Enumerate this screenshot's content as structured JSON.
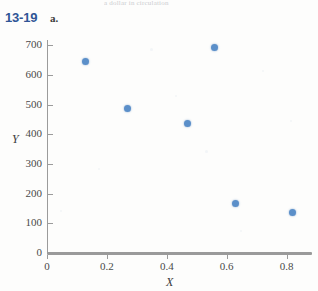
{
  "header": {
    "exercise_number": "13-19",
    "part_label": "a.",
    "top_cut_text": "a dollar in circulation"
  },
  "colors": {
    "marker": "#5b8fc9",
    "exercise_number": "#2f5596",
    "axis": "#9b9b9b",
    "text": "#4a4a4a"
  },
  "chart_data": {
    "type": "scatter",
    "title": "",
    "xlabel": "X",
    "ylabel": "Y",
    "xlim": [
      0,
      0.885
    ],
    "ylim": [
      0,
      715
    ],
    "grid": false,
    "legend": null,
    "xticks": [
      "0",
      "0.2",
      "0.4",
      "0.6",
      "0.8"
    ],
    "xtick_values": [
      0,
      0.2,
      0.4,
      0.6,
      0.8
    ],
    "yticks": [
      "0",
      "100",
      "200",
      "300",
      "400",
      "500",
      "600",
      "700"
    ],
    "ytick_values": [
      0,
      100,
      200,
      300,
      400,
      500,
      600,
      700
    ],
    "points": [
      {
        "x": 0.13,
        "y": 645
      },
      {
        "x": 0.27,
        "y": 487
      },
      {
        "x": 0.47,
        "y": 437
      },
      {
        "x": 0.56,
        "y": 692
      },
      {
        "x": 0.63,
        "y": 167
      },
      {
        "x": 0.82,
        "y": 138
      }
    ]
  }
}
